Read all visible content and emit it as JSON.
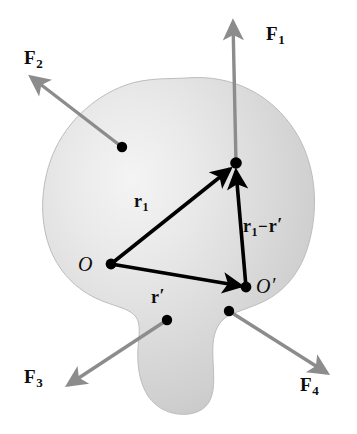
{
  "figure": {
    "type": "physics-diagram",
    "background_color": "#ffffff"
  },
  "body": {
    "name": "rigid-body-blob",
    "fill_color": "#d2d2d2",
    "highlight_color": "#f2f2f2",
    "edge_color": "#b9b9b9"
  },
  "forces": {
    "arrow_color": "#8c8c8c",
    "items": [
      {
        "id": "F1",
        "label": "F",
        "subscript": "1",
        "direction": "up",
        "label_x": 266,
        "label_y": 24,
        "application_point": [
          236,
          163
        ],
        "tip": [
          233,
          18
        ]
      },
      {
        "id": "F2",
        "label": "F",
        "subscript": "2",
        "direction": "upper-left",
        "label_x": 24,
        "label_y": 48,
        "application_point": [
          122,
          147
        ],
        "tip": [
          26,
          78
        ]
      },
      {
        "id": "F3",
        "label": "F",
        "subscript": "3",
        "direction": "lower-left",
        "label_x": 24,
        "label_y": 367,
        "application_point": [
          167,
          320
        ],
        "tip": [
          64,
          388
        ]
      },
      {
        "id": "F4",
        "label": "F",
        "subscript": "4",
        "direction": "lower-right",
        "label_x": 300,
        "label_y": 375,
        "application_point": [
          229,
          311
        ],
        "tip": [
          331,
          375
        ]
      }
    ]
  },
  "points": [
    {
      "id": "O",
      "label": "O",
      "prime": "",
      "x": 111,
      "y": 264,
      "label_x": 78,
      "label_y": 254
    },
    {
      "id": "Oprime",
      "label": "O",
      "prime": "′",
      "x": 246,
      "y": 287,
      "label_x": 256,
      "label_y": 276
    },
    {
      "id": "P",
      "label": "",
      "prime": "",
      "x": 236,
      "y": 163,
      "label_x": 0,
      "label_y": 0
    }
  ],
  "vectors": {
    "color": "#000000",
    "items": [
      {
        "id": "r1",
        "label": "r",
        "subscript": "1",
        "prime": "",
        "from": "O",
        "to": "P",
        "label_x": 134,
        "label_y": 192
      },
      {
        "id": "rprime",
        "label": "r",
        "subscript": "",
        "prime": "′",
        "from": "O",
        "to": "Oprime",
        "label_x": 151,
        "label_y": 288
      },
      {
        "id": "r1-rprime",
        "label": "r",
        "subscript": "1",
        "minus": "−",
        "label2": "r",
        "prime": "′",
        "from": "Oprime",
        "to": "P",
        "label_x": 243,
        "label_y": 217
      }
    ]
  }
}
